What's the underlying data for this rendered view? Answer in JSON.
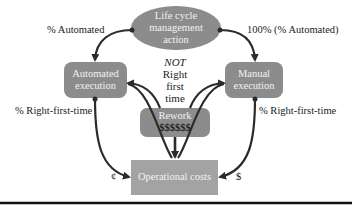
{
  "diagram": {
    "nodes": {
      "lifecycle": {
        "lines": [
          "Life cycle",
          "management",
          "action"
        ],
        "shape": "ellipse"
      },
      "automated": {
        "lines": [
          "Automated",
          "execution"
        ],
        "shape": "rounded-rect"
      },
      "manual": {
        "lines": [
          "Manual",
          "execution"
        ],
        "shape": "rounded-rect"
      },
      "rework": {
        "lines": [
          "Rework",
          "$$$$$$"
        ],
        "shape": "rounded-rect"
      },
      "operational": {
        "label": "Operational costs",
        "shape": "rect"
      }
    },
    "edge_labels": {
      "automated_pct": "% Automated",
      "manual_pct": "100% (% Automated)",
      "rft_left": "% Right-first-time",
      "rft_right": "% Right-first-time",
      "cost_left": "¢",
      "cost_right": "$"
    },
    "center_note": {
      "not": "NOT",
      "right": "Right",
      "first": "first",
      "time": "time"
    },
    "colors": {
      "node_fill": "#8c8c8c",
      "operational_fill": "#a3a3a3",
      "node_text": "#f2f2f2",
      "arrow": "#2b2b2b",
      "separator": "#111111"
    }
  }
}
